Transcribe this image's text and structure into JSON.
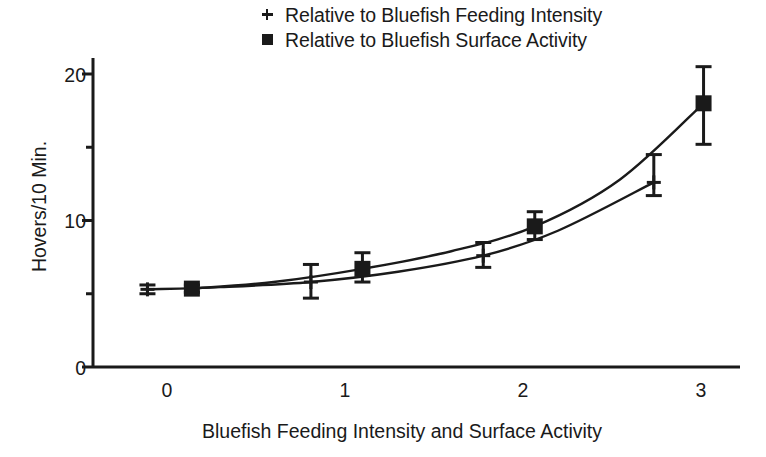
{
  "chart_data": {
    "type": "line",
    "title": "",
    "xlabel": "Bluefish Feeding Intensity and Surface Activity",
    "ylabel": "Hovers/10 Min.",
    "xlim": [
      -0.25,
      3.2
    ],
    "ylim": [
      0,
      21.5
    ],
    "xticks": [
      0,
      1,
      2,
      3
    ],
    "xtick_labels": [
      "0",
      "1",
      "2",
      "3"
    ],
    "yticks": [
      0,
      5,
      10,
      15,
      20
    ],
    "ytick_labels": [
      "0",
      "",
      "10",
      "",
      "20"
    ],
    "ytick_major": [
      0,
      10,
      20
    ],
    "ytick_minor": [
      5,
      15
    ],
    "grid": false,
    "legend_position": "top-center",
    "marker_color": "#1a1a1a",
    "line_color": "#1a1a1a",
    "series": [
      {
        "name": "Relative to Bluefish Feeding Intensity",
        "marker": "plus",
        "x": [
          -0.11,
          0.81,
          1.78,
          2.74
        ],
        "y": [
          5.3,
          5.8,
          7.6,
          12.6
        ],
        "yerr_low": [
          5.0,
          4.7,
          6.8,
          11.7
        ],
        "yerr_high": [
          5.6,
          7.0,
          8.5,
          14.5
        ]
      },
      {
        "name": "Relative to Bluefish Surface Activity",
        "marker": "square",
        "x": [
          0.14,
          1.1,
          2.07,
          3.02
        ],
        "y": [
          5.35,
          6.7,
          9.6,
          18.0
        ],
        "yerr_low": [
          5.1,
          5.8,
          8.7,
          15.2
        ],
        "yerr_high": [
          5.6,
          7.8,
          10.6,
          20.5
        ]
      }
    ],
    "fitted_curves": [
      {
        "name": "Relative to Bluefish Feeding Intensity",
        "points_x": [
          -0.11,
          0.3,
          0.81,
          1.3,
          1.78,
          2.2,
          2.74
        ],
        "points_y": [
          5.3,
          5.45,
          5.8,
          6.5,
          7.6,
          9.3,
          12.6
        ]
      },
      {
        "name": "Relative to Bluefish Surface Activity",
        "points_x": [
          0.14,
          0.6,
          1.1,
          1.6,
          2.07,
          2.55,
          3.02
        ],
        "points_y": [
          5.35,
          5.8,
          6.7,
          7.9,
          9.6,
          12.8,
          18.0
        ]
      }
    ]
  },
  "legend": {
    "items": [
      {
        "marker": "plus-marker",
        "label": "Relative to Bluefish Feeding Intensity"
      },
      {
        "marker": "square-marker",
        "label": "Relative to Bluefish Surface Activity"
      }
    ]
  },
  "axes": {
    "y_title": "Hovers/10 Min.",
    "x_title": "Bluefish Feeding Intensity and Surface Activity",
    "y_labels": [
      "20",
      "10",
      "0"
    ],
    "x_labels": [
      "0",
      "1",
      "2",
      "3"
    ]
  }
}
